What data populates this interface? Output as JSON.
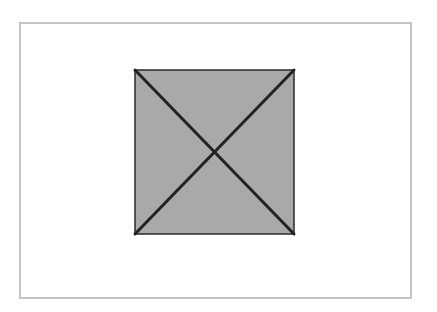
{
  "diagram": {
    "frame": {
      "x": 19,
      "y": 22,
      "width": 391,
      "height": 275,
      "border_color": "#c4c4c4"
    },
    "square": {
      "x": 135,
      "y": 70,
      "width": 159,
      "height": 164,
      "fill": "#a9a9a9",
      "stroke": "#2a2a2a",
      "diagonals": [
        {
          "x1": 135,
          "y1": 70,
          "x2": 294,
          "y2": 234
        },
        {
          "x1": 294,
          "y1": 70,
          "x2": 135,
          "y2": 234
        }
      ],
      "diagonal_color": "#222222"
    }
  }
}
